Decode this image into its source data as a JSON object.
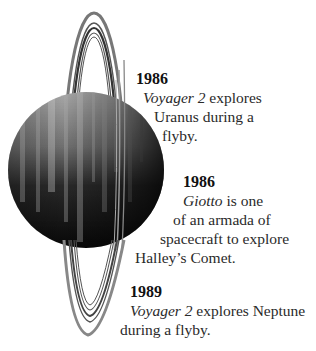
{
  "illustration": {
    "subject": "Uranus with rings",
    "planet_color_light": "#9a9a9a",
    "planet_color_dark": "#0e0e0e",
    "ring_color": "#555555"
  },
  "timeline": [
    {
      "year": "1986",
      "lines": [
        {
          "italic": "Voyager 2",
          "rest": " explores"
        },
        {
          "text": "Uranus during a"
        },
        {
          "text": "flyby."
        }
      ]
    },
    {
      "year": "1986",
      "lines": [
        {
          "italic": "Giotto",
          "rest": " is one"
        },
        {
          "text": "of an armada of"
        },
        {
          "text": "spacecraft to explore"
        },
        {
          "text": "Halley’s Comet."
        }
      ]
    },
    {
      "year": "1989",
      "lines": [
        {
          "italic": "Voyager 2",
          "rest": " explores Neptune"
        },
        {
          "text": "during a flyby."
        }
      ]
    }
  ]
}
